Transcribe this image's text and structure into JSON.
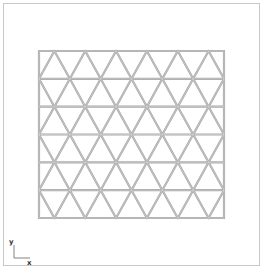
{
  "diagram": {
    "type": "triangular-mesh",
    "mesh": {
      "rows": 6,
      "top_row_apex_count": 6,
      "bounds_px": {
        "x0": 39,
        "y0": 51,
        "x1": 224,
        "y1": 218
      },
      "edge_color": "#a8a8a8",
      "edge_highlight": "#d8d8d8",
      "edge_width": 2.2
    },
    "frame_color": "#c8c8c8"
  },
  "axis_triad": {
    "y_label": "y",
    "x_label": "x",
    "color": "#555555"
  }
}
